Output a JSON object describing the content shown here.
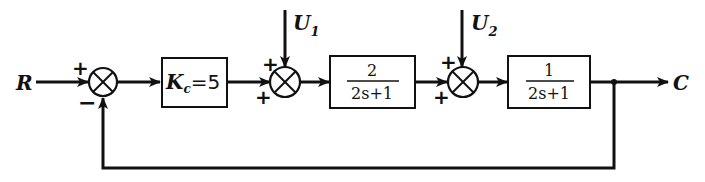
{
  "diagram": {
    "type": "control-system-block-diagram",
    "input": {
      "label": "R"
    },
    "output": {
      "label": "C"
    },
    "disturbances": [
      {
        "label": "U",
        "subscript": "1"
      },
      {
        "label": "U",
        "subscript": "2"
      }
    ],
    "summing_junctions": [
      {
        "id": "sum1",
        "signs": {
          "top": "+",
          "bottom": "−"
        }
      },
      {
        "id": "sum2",
        "signs": {
          "top": "+",
          "bottom": "+"
        }
      },
      {
        "id": "sum3",
        "signs": {
          "top": "+",
          "bottom": "+"
        }
      }
    ],
    "blocks": [
      {
        "id": "controller",
        "symbol": "K",
        "subscript": "c",
        "equals": "=5"
      },
      {
        "id": "plant1",
        "numerator": "2",
        "denominator": "2s+1"
      },
      {
        "id": "plant2",
        "numerator": "1",
        "denominator": "2s+1"
      }
    ],
    "feedback": {
      "type": "unity",
      "sign": "−"
    },
    "colors": {
      "stroke": "#111111",
      "background": "#ffffff"
    }
  }
}
